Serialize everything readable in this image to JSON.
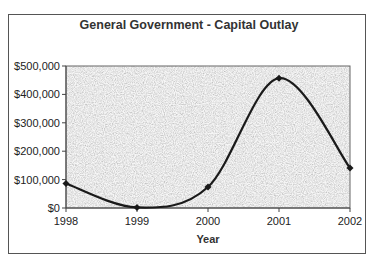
{
  "chart_data": {
    "type": "line",
    "title": "General Government - Capital Outlay",
    "xlabel": "Year",
    "ylabel": "",
    "categories": [
      "1998",
      "1999",
      "2000",
      "2001",
      "2002"
    ],
    "series": [
      {
        "name": "Capital Outlay",
        "values": [
          86000,
          2000,
          74000,
          457000,
          141000
        ]
      }
    ],
    "ylim": [
      0,
      500000
    ],
    "yticks": [
      "$0",
      "$100,000",
      "$200,000",
      "$300,000",
      "$400,000",
      "$500,000"
    ],
    "smoothed": true,
    "legend": "none",
    "grid": false,
    "plot_background": "#c8c8c8 granite texture",
    "line_color": "#1a1a1a"
  }
}
